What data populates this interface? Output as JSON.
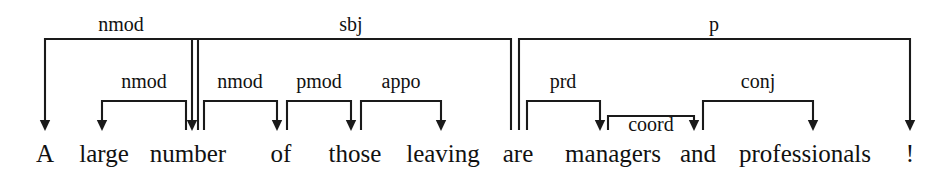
{
  "diagram": {
    "type": "dependency-parse-tree",
    "title": "",
    "sentence": "A large number of those leaving are managers and professionals !",
    "line_color": "#1a1a1a",
    "text_color": "#111111",
    "background_color": "#ffffff",
    "tokens": [
      {
        "id": 0,
        "text": "A",
        "x": 45
      },
      {
        "id": 1,
        "text": "large",
        "x": 104
      },
      {
        "id": 2,
        "text": "number",
        "x": 188
      },
      {
        "id": 3,
        "text": "of",
        "x": 281
      },
      {
        "id": 4,
        "text": "those",
        "x": 355
      },
      {
        "id": 5,
        "text": "leaving",
        "x": 443
      },
      {
        "id": 6,
        "text": "are",
        "x": 518
      },
      {
        "id": 7,
        "text": "managers",
        "x": 613
      },
      {
        "id": 8,
        "text": "and",
        "x": 698
      },
      {
        "id": 9,
        "text": "professionals",
        "x": 805
      },
      {
        "id": 10,
        "text": "!",
        "x": 910
      }
    ],
    "arcs": [
      {
        "label": "nmod",
        "head_token": "number",
        "dep_token": "A",
        "head_x": 198,
        "dep_x": 45,
        "top_y": 39,
        "label_x": 121,
        "label_y": 31
      },
      {
        "label": "sbj",
        "head_token": "are",
        "dep_token": "number",
        "head_x": 511,
        "dep_x": 192,
        "top_y": 39,
        "label_x": 351,
        "label_y": 31
      },
      {
        "label": "p",
        "head_token": "are",
        "dep_token": "!",
        "head_x": 519,
        "dep_x": 910,
        "top_y": 39,
        "label_x": 714,
        "label_y": 31
      },
      {
        "label": "nmod",
        "head_token": "number",
        "dep_token": "large",
        "head_x": 186,
        "dep_x": 102,
        "top_y": 101,
        "label_x": 144,
        "label_y": 88
      },
      {
        "label": "nmod",
        "head_token": "number",
        "dep_token": "of",
        "head_x": 204,
        "dep_x": 277,
        "top_y": 101,
        "label_x": 240,
        "label_y": 88
      },
      {
        "label": "pmod",
        "head_token": "of",
        "dep_token": "those",
        "head_x": 287,
        "dep_x": 351,
        "top_y": 101,
        "label_x": 319,
        "label_y": 88
      },
      {
        "label": "appo",
        "head_token": "those",
        "dep_token": "leaving",
        "head_x": 361,
        "dep_x": 441,
        "top_y": 101,
        "label_x": 401,
        "label_y": 88
      },
      {
        "label": "prd",
        "head_token": "are",
        "dep_token": "managers",
        "head_x": 527,
        "dep_x": 600,
        "top_y": 101,
        "label_x": 563,
        "label_y": 88
      },
      {
        "label": "conj",
        "head_token": "managers",
        "dep_token": "professionals",
        "head_x": 703,
        "dep_x": 813,
        "top_y": 101,
        "label_x": 758,
        "label_y": 88
      },
      {
        "label": "coord",
        "head_token": "managers",
        "dep_token": "and",
        "head_x": 608,
        "dep_x": 694,
        "top_y": 116,
        "label_x": 651,
        "label_y": 131
      }
    ],
    "baseline_y": 130,
    "token_baseline_y": 162
  }
}
